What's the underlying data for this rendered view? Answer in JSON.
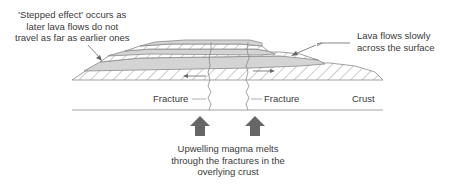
{
  "annotations": {
    "stepped_effect": [
      "'Stepped effect' occurs as",
      "later lava flows do not",
      "travel as far as earlier ones"
    ],
    "lava_flows": [
      "Lava flows slowly",
      "across the surface"
    ],
    "fracture_left": "Fracture",
    "fracture_right": "Fracture",
    "crust": "Crust",
    "upwelling": [
      "Upwelling magma melts",
      "through the fractures in the",
      "overlying crust"
    ]
  },
  "colors": {
    "lava_fill": "#d4d4d4",
    "outline": "#8a8a8a",
    "hatch": "#9a9a9a",
    "arrow": "#666666",
    "text": "#3a3a3a"
  }
}
